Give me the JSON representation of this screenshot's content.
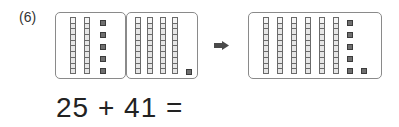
{
  "problem": {
    "number_label": "(6)",
    "equation": "25 + 41 =",
    "addend_1": 25,
    "addend_2": 41,
    "operator": "+",
    "equals": "=",
    "answer_shown": ""
  },
  "blocks": {
    "left_group": {
      "represents": 25,
      "tens_rods": 2,
      "units": 5
    },
    "middle_group": {
      "represents": 41,
      "tens_rods": 4,
      "units": 1
    },
    "result_group": {
      "represents": 66,
      "tens_rods": 6,
      "units": 6
    }
  },
  "icons": {
    "arrow": "right-arrow-icon"
  },
  "colors": {
    "box_border": "#8a8a8a",
    "rod_fill": "#e6e6e6",
    "unit_fill": "#6f6f6f",
    "text": "#222222"
  }
}
